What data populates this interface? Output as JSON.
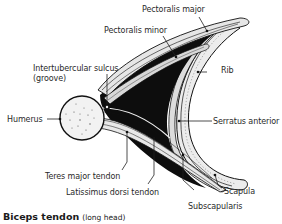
{
  "figure": {
    "caption_bold": "Biceps tendon",
    "caption_sub": "(long head)"
  },
  "labels": {
    "pectoralis_major": "Pectoralis major",
    "pectoralis_minor": "Pectoralis minor",
    "intertubercular_sulcus": "Intertubercular sulcus",
    "groove": "(groove)",
    "rib": "Rib",
    "humerus": "Humerus",
    "serratus_anterior": "Serratus anterior",
    "teres_major_tendon": "Teres major tendon",
    "latissimus_dorsi_tendon": "Latissimus dorsi tendon",
    "scapula": "Scapula",
    "subscapularis": "Subscapularis"
  },
  "colors": {
    "muscle_dark": "#0d0d0d",
    "muscle_light": "#e6e6e6",
    "bone": "#f2f2f2",
    "stroke": "#111111",
    "text": "#2a2a2a"
  }
}
